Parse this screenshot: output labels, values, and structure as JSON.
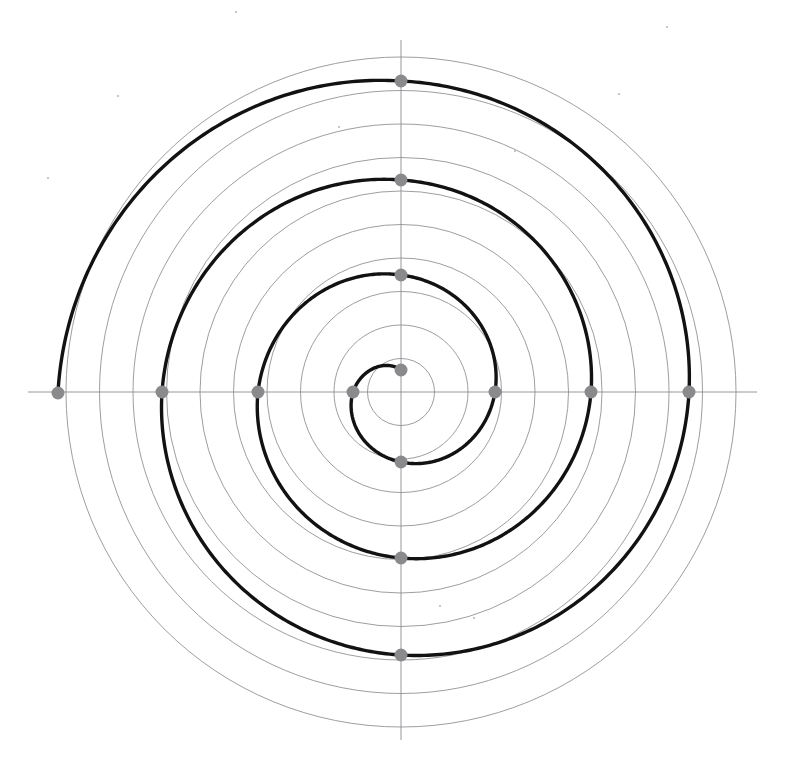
{
  "figure": {
    "kind": "polar-spiral-diagram",
    "canvas": {
      "width": 786,
      "height": 777,
      "background": "#ffffff"
    }
  },
  "chart_data": {
    "type": "line",
    "subtitle": "",
    "xlabel": "",
    "ylabel": "",
    "coordinate_system": "polar",
    "grid": true,
    "legend_position": "none",
    "center": {
      "x": 401,
      "y": 392
    },
    "axes": {
      "horizontal": {
        "y": 392,
        "x_start": 28,
        "x_end": 757
      },
      "vertical": {
        "x": 401,
        "y_start": 40,
        "y_end": 740
      }
    },
    "polar_grid": {
      "stroke": "#8d8d91",
      "ring_count": 10,
      "ring_spacing_px": 33.5,
      "ring_radii_px": [
        33.5,
        67,
        100.5,
        134,
        167.5,
        201,
        234.5,
        268,
        301.5,
        335
      ]
    },
    "series": [
      {
        "name": "Archimedean spiral r = a + b*theta",
        "stroke": "#121212",
        "stroke_width": 3.4,
        "direction": "counterclockwise",
        "turns": 3.45,
        "theta_start_deg": 90,
        "theta_end_deg": 1260,
        "r_start_px": 22,
        "r_end_px": 343,
        "b_px_per_turn": 93,
        "r_at_theta": [
          {
            "theta_deg": 90,
            "r_px": 22
          },
          {
            "theta_deg": 180,
            "r_px": 48
          },
          {
            "theta_deg": 270,
            "r_px": 70
          },
          {
            "theta_deg": 360,
            "r_px": 94
          },
          {
            "theta_deg": 450,
            "r_px": 117
          },
          {
            "theta_deg": 540,
            "r_px": 143
          },
          {
            "theta_deg": 630,
            "r_px": 166
          },
          {
            "theta_deg": 720,
            "r_px": 190
          },
          {
            "theta_deg": 810,
            "r_px": 212
          },
          {
            "theta_deg": 900,
            "r_px": 239
          },
          {
            "theta_deg": 990,
            "r_px": 263
          },
          {
            "theta_deg": 1080,
            "r_px": 288
          },
          {
            "theta_deg": 1170,
            "r_px": 311
          },
          {
            "theta_deg": 1260,
            "r_px": 343
          }
        ]
      }
    ],
    "markers": {
      "fill": "#8a8a8c",
      "radius_px": 6.5,
      "description": "gray dots where the spiral crosses the horizontal and vertical axes",
      "points": [
        {
          "label": "up-1",
          "x": 401,
          "y": 370,
          "r_px": 22,
          "theta_deg": 90
        },
        {
          "label": "left-1",
          "x": 353,
          "y": 392,
          "r_px": 48,
          "theta_deg": 180
        },
        {
          "label": "down-1",
          "x": 401,
          "y": 462,
          "r_px": 70,
          "theta_deg": 270
        },
        {
          "label": "right-1",
          "x": 495,
          "y": 392,
          "r_px": 94,
          "theta_deg": 360
        },
        {
          "label": "up-2",
          "x": 401,
          "y": 275,
          "r_px": 117,
          "theta_deg": 450
        },
        {
          "label": "left-2",
          "x": 258,
          "y": 392,
          "r_px": 143,
          "theta_deg": 540
        },
        {
          "label": "down-2",
          "x": 401,
          "y": 558,
          "r_px": 166,
          "theta_deg": 630
        },
        {
          "label": "right-2",
          "x": 591,
          "y": 392,
          "r_px": 190,
          "theta_deg": 720
        },
        {
          "label": "up-3",
          "x": 401,
          "y": 180,
          "r_px": 212,
          "theta_deg": 810
        },
        {
          "label": "left-3",
          "x": 162,
          "y": 392,
          "r_px": 239,
          "theta_deg": 900
        },
        {
          "label": "down-3",
          "x": 401,
          "y": 655,
          "r_px": 263,
          "theta_deg": 990
        },
        {
          "label": "right-3",
          "x": 689,
          "y": 392,
          "r_px": 288,
          "theta_deg": 1080
        },
        {
          "label": "up-4",
          "x": 401,
          "y": 81,
          "r_px": 311,
          "theta_deg": 1170
        },
        {
          "label": "left-4",
          "x": 58,
          "y": 393,
          "r_px": 343,
          "theta_deg": 1260
        }
      ]
    },
    "specks": [
      {
        "x": 236,
        "y": 12
      },
      {
        "x": 667,
        "y": 27
      },
      {
        "x": 48,
        "y": 178
      },
      {
        "x": 339,
        "y": 127
      },
      {
        "x": 515,
        "y": 151
      },
      {
        "x": 619,
        "y": 94
      },
      {
        "x": 474,
        "y": 618
      },
      {
        "x": 440,
        "y": 606
      },
      {
        "x": 118,
        "y": 96
      }
    ]
  }
}
